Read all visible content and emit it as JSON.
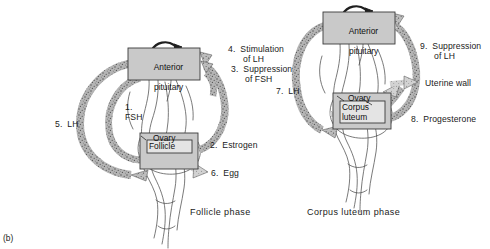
{
  "figure": {
    "panel_tag": "(b)",
    "background_color": "#ffffff",
    "box_fill_color": "#c9c9c9",
    "box_stroke_color": "#3a3a3a",
    "arrow_fill_color": "#9a9a9a",
    "text_color": "#1a1a1a"
  },
  "left_diagram": {
    "caption": "Follicle phase",
    "pituitary_box": {
      "line1": "Anterior",
      "line2": "pituitary"
    },
    "ovary_box": {
      "label": "Ovary",
      "inner_label": "Follicle"
    },
    "annotations": [
      {
        "id": "fsh",
        "number": "1.",
        "text": "FSH"
      },
      {
        "id": "estrogen",
        "number": "2.",
        "text": "Estrogen"
      },
      {
        "id": "suppr_fsh",
        "number": "3.",
        "text": "Suppression\nof FSH"
      },
      {
        "id": "stim_lh",
        "number": "4.",
        "text": "Stimulation\nof LH"
      },
      {
        "id": "lh",
        "number": "5.",
        "text": "LH"
      },
      {
        "id": "egg",
        "number": "6.",
        "text": "Egg"
      }
    ]
  },
  "right_diagram": {
    "caption": "Corpus luteum phase",
    "pituitary_box": {
      "line1": "Anterior",
      "line2": "pituitary"
    },
    "ovary_box": {
      "label": "Ovary",
      "inner_line1": "Corpus",
      "inner_line2": "luteum"
    },
    "annotations": [
      {
        "id": "lh7",
        "number": "7.",
        "text": "LH"
      },
      {
        "id": "progesterone",
        "number": "8.",
        "text": "Progesterone"
      },
      {
        "id": "suppr_lh",
        "number": "9.",
        "text": "Suppression\nof LH"
      },
      {
        "id": "uterine_wall",
        "number": "",
        "text": "Uterine wall"
      }
    ]
  },
  "labels": {
    "l_1_fsh_num": "1.",
    "l_1_fsh_txt": "FSH",
    "l_2_est": "2.  Estrogen",
    "l_3_sup_a": "3.  Suppression",
    "l_3_sup_b": "of FSH",
    "l_4_stim_a": "4.  Stimulation",
    "l_4_stim_b": "of LH",
    "l_5_lh": "5.  LH",
    "l_6_egg": "6.  Egg",
    "l_7_lh": "7.  LH",
    "l_8_prog": "8.  Progesterone",
    "l_9_sup_a": "9.  Suppression",
    "l_9_sup_b": "of LH",
    "l_uterine": "Uterine wall",
    "cap_follicle": "Follicle phase",
    "cap_corpus": "Corpus luteum phase",
    "panel_tag": "(b)",
    "box_ant": "Anterior",
    "box_pit": "pituitary",
    "box_ovary": "Ovary",
    "box_follicle": "Follicle",
    "box_corpus": "Corpus",
    "box_luteum": "luteum"
  }
}
